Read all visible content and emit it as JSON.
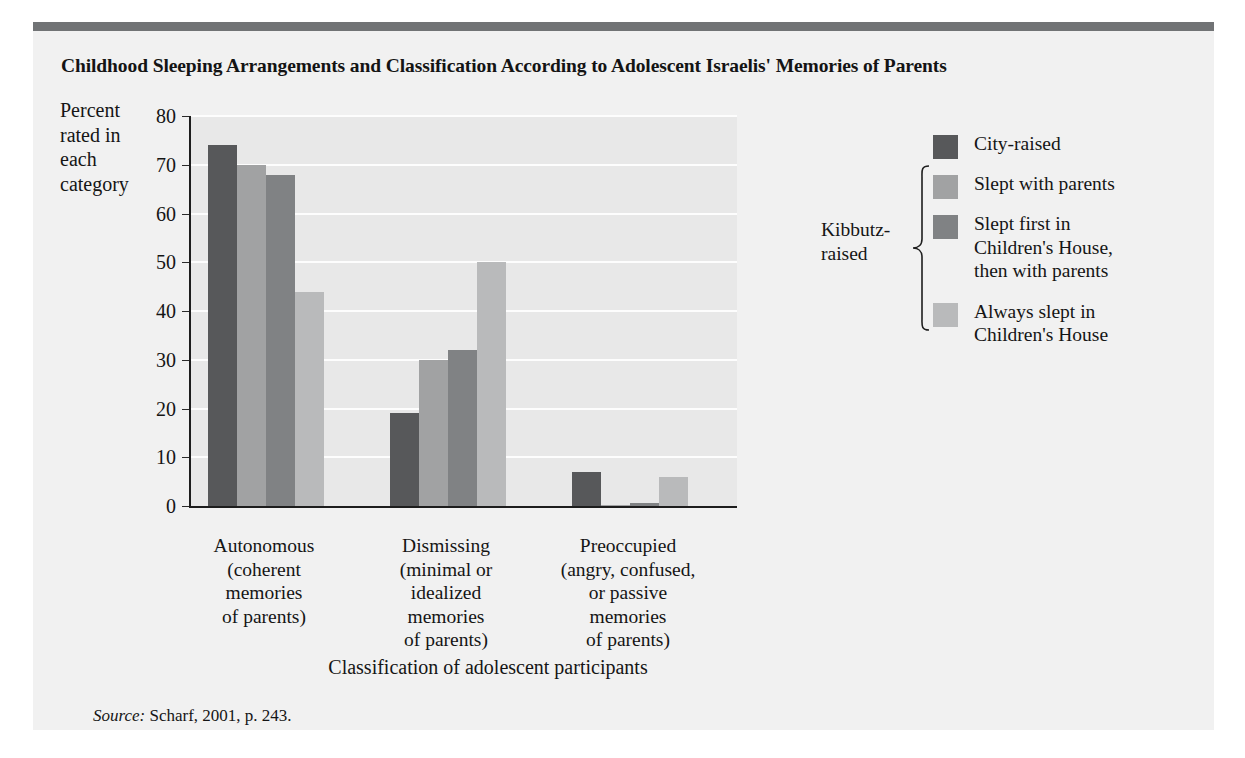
{
  "figure": {
    "title": "Childhood Sleeping Arrangements and Classification According to Adolescent Israelis' Memories of Parents",
    "source_word": "Source:",
    "source_text": " Scharf, 2001, p. 243.",
    "top_rule_color": "#717375",
    "panel_background": "#f1f1f1",
    "plot_background": "#e8e8e8",
    "gridline_color": "#fdfdfd",
    "axis_color": "#1d1d1d"
  },
  "axes": {
    "ylabel_lines": "Percent rated in each category",
    "ylabel_line1": "Percent",
    "ylabel_line2": "rated in",
    "ylabel_line3": "each",
    "ylabel_line4": "category",
    "xtitle": "Classification of adolescent participants",
    "yticks": [
      "80",
      "70",
      "60",
      "50",
      "40",
      "30",
      "20",
      "10",
      "0"
    ]
  },
  "legend": {
    "bracket_label_line1": "Kibbutz-",
    "bracket_label_line2": "raised",
    "items": [
      {
        "label": "City-raised",
        "color": "#57585a",
        "lines": [
          "City-raised"
        ]
      },
      {
        "label": "Slept with parents",
        "color": "#a1a2a3",
        "lines": [
          "Slept with parents"
        ]
      },
      {
        "label": "Slept first in Children's House, then with parents",
        "color": "#808284",
        "lines": [
          "Slept first in",
          "Children's House,",
          "then with parents"
        ]
      },
      {
        "label": "Always slept in Children's House",
        "color": "#b9babb",
        "lines": [
          "Always slept in",
          "Children's House"
        ]
      }
    ]
  },
  "chart_data": {
    "type": "bar",
    "title": "Childhood Sleeping Arrangements and Classification According to Adolescent Israelis' Memories of Parents",
    "subtitle": "",
    "xlabel": "Classification of adolescent participants",
    "ylabel": "Percent rated in each category",
    "ylim": [
      0,
      80
    ],
    "ytick_step": 10,
    "grid": true,
    "legend_position": "right",
    "categories": [
      "Autonomous (coherent memories of parents)",
      "Dismissing (minimal or idealized memories of parents)",
      "Preoccupied (angry, confused, or passive memories of parents)"
    ],
    "category_lines": [
      [
        "Autonomous",
        "(coherent",
        "memories",
        "of parents)"
      ],
      [
        "Dismissing",
        "(minimal or",
        "idealized",
        "memories",
        "of parents)"
      ],
      [
        "Preoccupied",
        "(angry, confused,",
        "or passive",
        "memories",
        "of parents)"
      ]
    ],
    "series": [
      {
        "name": "City-raised",
        "color": "#57585a",
        "values": [
          74,
          19,
          7
        ]
      },
      {
        "name": "Slept with parents",
        "color": "#a1a2a3",
        "values": [
          70,
          30,
          0.3
        ]
      },
      {
        "name": "Slept first in Children's House, then with parents",
        "color": "#808284",
        "values": [
          68,
          32,
          0.6
        ]
      },
      {
        "name": "Always slept in Children's House",
        "color": "#b9babb",
        "values": [
          44,
          50,
          6
        ]
      }
    ],
    "source": "Source: Scharf, 2001, p. 243."
  }
}
